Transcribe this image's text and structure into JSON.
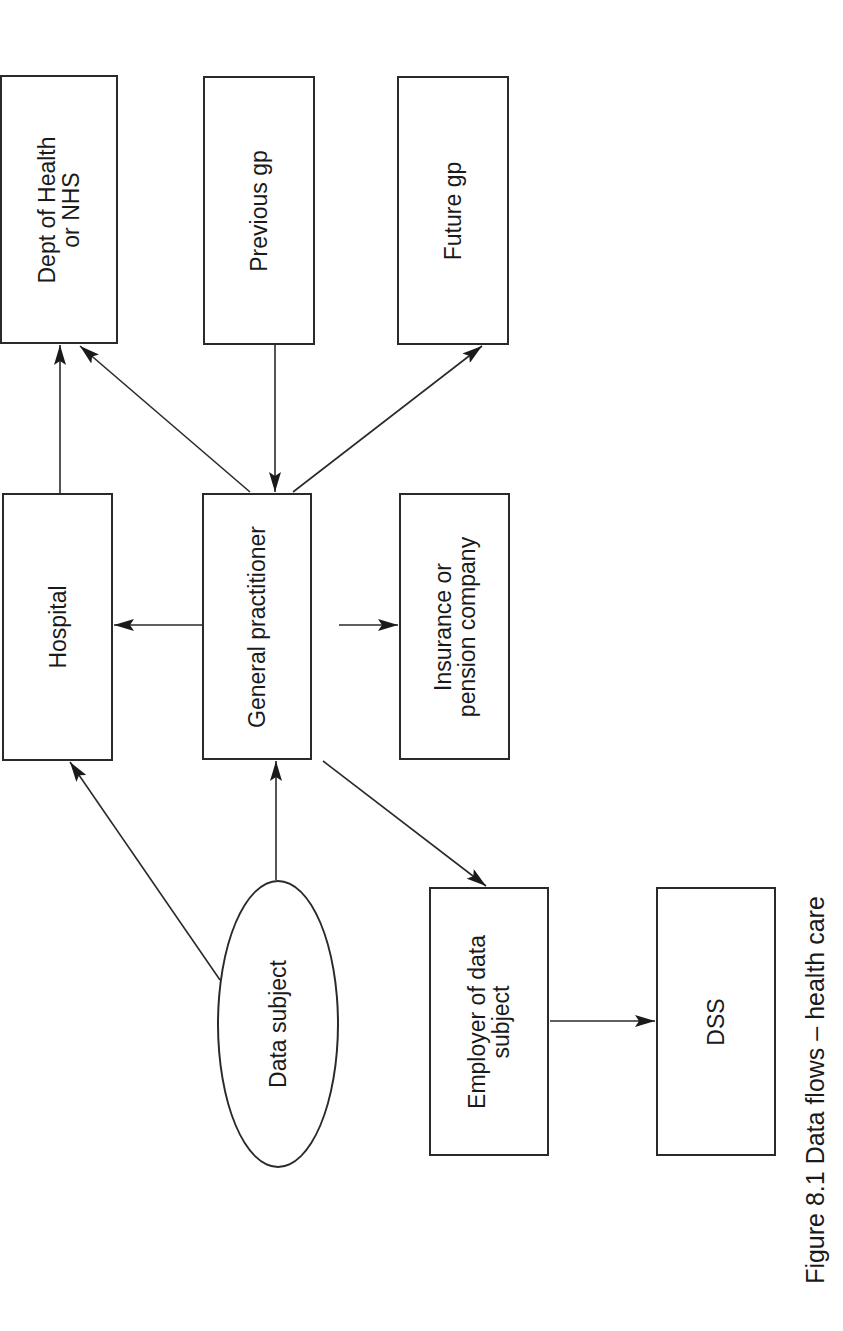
{
  "figure": {
    "caption": "Figure 8.1 Data flows – health care",
    "stroke_color": "#2a2a2a",
    "text_color": "#1a1a1a",
    "background": "#ffffff"
  },
  "nodes": [
    {
      "id": "dept_health",
      "label": "Dept of Health\nor NHS",
      "shape": "rect",
      "x": 0,
      "y": 75,
      "w": 118,
      "h": 269
    },
    {
      "id": "previous_gp",
      "label": "Previous gp",
      "shape": "rect",
      "x": 203,
      "y": 76,
      "w": 112,
      "h": 269
    },
    {
      "id": "future_gp",
      "label": "Future gp",
      "shape": "rect",
      "x": 397,
      "y": 76,
      "w": 112,
      "h": 269
    },
    {
      "id": "hospital",
      "label": "Hospital",
      "shape": "rect",
      "x": 2,
      "y": 493,
      "w": 111,
      "h": 268
    },
    {
      "id": "general_practitioner",
      "label": "General practitioner",
      "shape": "rect",
      "x": 202,
      "y": 493,
      "w": 110,
      "h": 267
    },
    {
      "id": "insurance",
      "label": "Insurance or\npension company",
      "shape": "rect",
      "x": 399,
      "y": 493,
      "w": 111,
      "h": 267
    },
    {
      "id": "data_subject",
      "label": "Data subject",
      "shape": "ellipse",
      "x": 217,
      "y": 880,
      "w": 122,
      "h": 288
    },
    {
      "id": "employer",
      "label": "Employer of data\nsubject",
      "shape": "rect",
      "x": 429,
      "y": 887,
      "w": 120,
      "h": 269
    },
    {
      "id": "dss",
      "label": "DSS",
      "shape": "rect",
      "x": 656,
      "y": 887,
      "w": 120,
      "h": 269
    }
  ],
  "edges": [
    {
      "from": "hospital",
      "to": "dept_health",
      "x1": 60,
      "y1": 493,
      "x2": 60,
      "y2": 345
    },
    {
      "from": "general_practitioner",
      "to": "dept_health",
      "x1": 250,
      "y1": 492,
      "x2": 80,
      "y2": 346
    },
    {
      "from": "previous_gp",
      "to": "general_practitioner",
      "x1": 275,
      "y1": 345,
      "x2": 275,
      "y2": 492
    },
    {
      "from": "general_practitioner",
      "to": "future_gp",
      "x1": 293,
      "y1": 492,
      "x2": 482,
      "y2": 346
    },
    {
      "from": "general_practitioner",
      "to": "hospital",
      "x1": 215,
      "y1": 625,
      "x2": 114,
      "y2": 625
    },
    {
      "from": "general_practitioner",
      "to": "insurance",
      "x1": 339,
      "y1": 625,
      "x2": 398,
      "y2": 625
    },
    {
      "from": "data_subject",
      "to": "hospital",
      "x1": 220,
      "y1": 980,
      "x2": 70,
      "y2": 762
    },
    {
      "from": "data_subject",
      "to": "general_practitioner",
      "x1": 276,
      "y1": 880,
      "x2": 276,
      "y2": 761
    },
    {
      "from": "general_practitioner",
      "to": "employer",
      "x1": 323,
      "y1": 761,
      "x2": 486,
      "y2": 886
    },
    {
      "from": "employer",
      "to": "dss",
      "x1": 550,
      "y1": 1021,
      "x2": 655,
      "y2": 1021
    }
  ]
}
